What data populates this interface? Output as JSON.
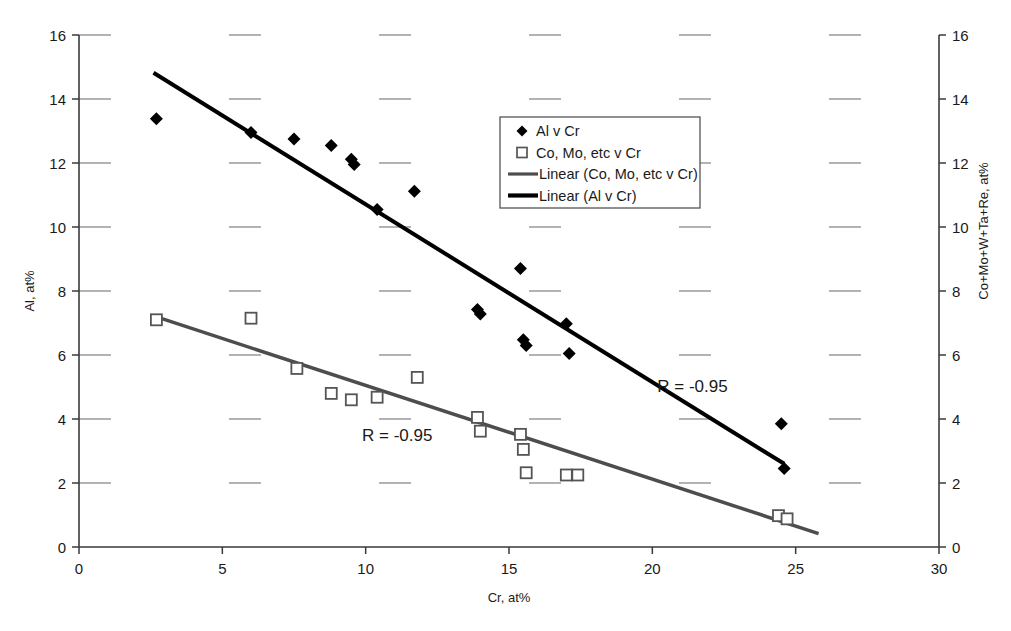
{
  "chart_data": {
    "type": "scatter",
    "title": "",
    "xlabel": "Cr, at%",
    "ylabel": "Al, at%",
    "y2label": "Co+Mo+W+Ta+Re, at%",
    "xlim": [
      0,
      30
    ],
    "ylim": [
      0,
      16
    ],
    "y2lim": [
      0,
      16
    ],
    "xticks": [
      "0",
      "5",
      "10",
      "15",
      "20",
      "25",
      "30"
    ],
    "xtickvals": [
      0,
      5,
      10,
      15,
      20,
      25,
      30
    ],
    "yticks": [
      "0",
      "2",
      "4",
      "6",
      "8",
      "10",
      "12",
      "14",
      "16"
    ],
    "ytickvals": [
      0,
      2,
      4,
      6,
      8,
      10,
      12,
      14,
      16
    ],
    "y2ticks": [
      "0",
      "2",
      "4",
      "6",
      "8",
      "10",
      "12",
      "14",
      "16"
    ],
    "y2tickvals": [
      0,
      2,
      4,
      6,
      8,
      10,
      12,
      14,
      16
    ],
    "grid": "horizontal-dashed",
    "legend_position": "upper-center",
    "legend": [
      {
        "label": "Al v Cr",
        "marker": "filled-diamond",
        "color": "#000000"
      },
      {
        "label": "Co, Mo, etc v Cr",
        "marker": "open-square",
        "color": "#555555"
      },
      {
        "label": "Linear (Co, Mo, etc v Cr)",
        "marker": "line",
        "color": "#4d4d4d"
      },
      {
        "label": "Linear (Al v Cr)",
        "marker": "line",
        "color": "#000000"
      }
    ],
    "series": [
      {
        "name": "Al v Cr",
        "marker": "filled-diamond",
        "color": "#000000",
        "axis": "left",
        "points": [
          [
            2.7,
            13.38
          ],
          [
            6.0,
            12.95
          ],
          [
            7.5,
            12.75
          ],
          [
            8.8,
            12.55
          ],
          [
            9.5,
            12.12
          ],
          [
            9.6,
            11.95
          ],
          [
            10.4,
            10.55
          ],
          [
            11.7,
            11.12
          ],
          [
            13.9,
            7.42
          ],
          [
            14.0,
            7.28
          ],
          [
            15.4,
            8.7
          ],
          [
            15.5,
            6.48
          ],
          [
            15.6,
            6.3
          ],
          [
            17.0,
            6.98
          ],
          [
            17.1,
            6.05
          ],
          [
            24.5,
            3.85
          ],
          [
            24.6,
            2.45
          ]
        ]
      },
      {
        "name": "Co, Mo, etc v Cr",
        "marker": "open-square",
        "color": "#555555",
        "axis": "right",
        "points": [
          [
            2.7,
            7.1
          ],
          [
            6.0,
            7.15
          ],
          [
            7.6,
            5.58
          ],
          [
            8.8,
            4.8
          ],
          [
            9.5,
            4.6
          ],
          [
            10.4,
            4.68
          ],
          [
            11.8,
            5.3
          ],
          [
            13.9,
            4.05
          ],
          [
            14.0,
            3.62
          ],
          [
            15.4,
            3.52
          ],
          [
            15.5,
            3.05
          ],
          [
            15.6,
            2.32
          ],
          [
            17.0,
            2.25
          ],
          [
            17.4,
            2.25
          ],
          [
            24.4,
            0.98
          ],
          [
            24.7,
            0.88
          ]
        ]
      }
    ],
    "trendlines": [
      {
        "name": "Linear (Al v Cr)",
        "color": "#000000",
        "width": 4,
        "axis": "left",
        "x0": 2.6,
        "y0": 14.82,
        "x1": 24.6,
        "y1": 2.6,
        "annotation": "R = -0.95",
        "annotation_x": 21.4,
        "annotation_y": 4.85
      },
      {
        "name": "Linear (Co, Mo, etc v Cr)",
        "color": "#4d4d4d",
        "width": 3.5,
        "axis": "right",
        "x0": 2.6,
        "y0": 7.22,
        "x1": 25.8,
        "y1": 0.42,
        "annotation": "R = -0.95",
        "annotation_x": 11.1,
        "annotation_y": 3.3
      }
    ]
  }
}
